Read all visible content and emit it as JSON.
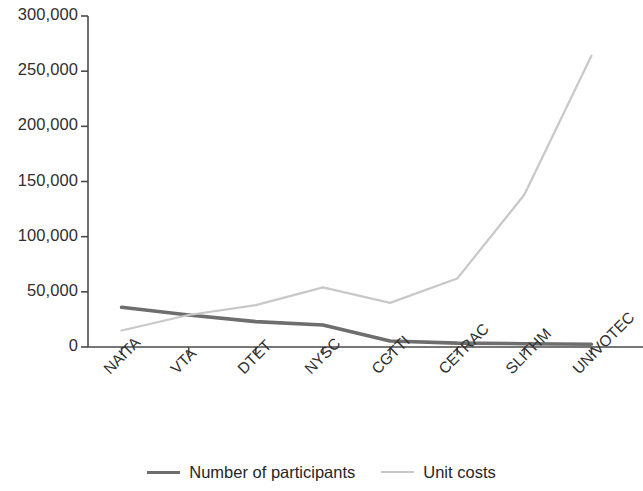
{
  "chart_data": {
    "type": "line",
    "title": "",
    "subtitle": "",
    "xlabel": "",
    "ylabel": "",
    "categories": [
      "NAITA",
      "VTA",
      "DTET",
      "NYSC",
      "CGTTI",
      "CETRAC",
      "SLITHM",
      "UNIVOTEC"
    ],
    "series": [
      {
        "name": "Number of participants",
        "color": "#6e6e6e",
        "values": [
          36000,
          29000,
          23000,
          20000,
          5500,
          3500,
          3000,
          2500
        ]
      },
      {
        "name": "Unit costs",
        "color": "#c8c8c8",
        "values": [
          15000,
          29000,
          38000,
          54000,
          40000,
          62000,
          138000,
          264000
        ]
      }
    ],
    "ylim": [
      0,
      300000
    ],
    "y_ticks": [
      0,
      50000,
      100000,
      150000,
      200000,
      250000,
      300000
    ],
    "y_tick_labels": [
      "0",
      "50,000",
      "100,000",
      "150,000",
      "200,000",
      "250,000",
      "300,000"
    ],
    "grid": false,
    "legend_position": "bottom"
  },
  "axis": {
    "y_axis_name": "value-axis",
    "x_axis_name": "category-axis"
  },
  "legend": {
    "entries": [
      {
        "label": "Number of participants",
        "color": "#6e6e6e"
      },
      {
        "label": "Unit costs",
        "color": "#c8c8c8"
      }
    ]
  }
}
